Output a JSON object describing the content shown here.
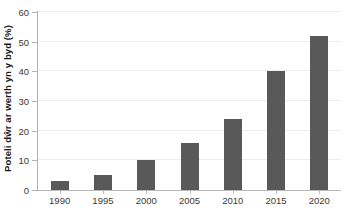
{
  "chart_data": {
    "type": "bar",
    "title": "",
    "xlabel": "",
    "ylabel": "Poteli dŵr ar werth yn y byd (%)",
    "categories": [
      "1990",
      "1995",
      "2000",
      "2005",
      "2010",
      "2015",
      "2020"
    ],
    "values": [
      3,
      5,
      10,
      16,
      24,
      40,
      52
    ],
    "ylim": [
      0,
      60
    ],
    "yticks": [
      0,
      10,
      20,
      30,
      40,
      50,
      60
    ],
    "ytick_labels": [
      "0",
      "10",
      "20",
      "30",
      "40",
      "50",
      "60"
    ],
    "grid": true,
    "legend": false,
    "bar_color": "#595959",
    "grid_color": "#ededed",
    "axis_color": "#b3b3b3",
    "series": [
      {
        "name": "Poteli dŵr ar werth yn y byd (%)",
        "values": [
          3,
          5,
          10,
          16,
          24,
          40,
          52
        ]
      }
    ]
  },
  "axes": {
    "y_title": "Poteli dŵr ar werth yn y byd (%)"
  }
}
